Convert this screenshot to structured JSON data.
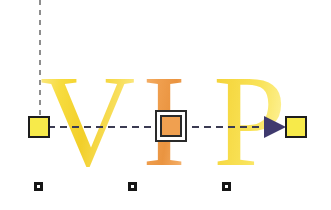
{
  "canvas": {
    "width": 331,
    "height": 210,
    "background": "#ffffff",
    "name": "gradient-edit-canvas"
  },
  "wordart": {
    "text": "VIP",
    "letters": [
      {
        "char": "V",
        "name": "letter-v",
        "color": "#f7dc3e",
        "highlight": "#fdf0a8"
      },
      {
        "char": "I",
        "name": "letter-i",
        "color": "#f0a050",
        "highlight": "#f8c58f"
      },
      {
        "char": "P",
        "name": "letter-p",
        "color": "#f6d943",
        "highlight": "#fffae0"
      }
    ]
  },
  "overlay": {
    "vertical_guide": {
      "name": "vertical-dashed-guide",
      "color": "#8d8d8d",
      "style": "dashed",
      "x": 40,
      "y_start": 0,
      "y_end": 120
    },
    "axis": {
      "name": "gradient-axis-line",
      "color": "#3b3b52",
      "style": "dash-dot",
      "y": 127,
      "x_start": 48,
      "x_end": 288
    },
    "handles": [
      {
        "name": "gradient-start-handle",
        "type": "square",
        "fill": "#f7ea4a",
        "border": "#1d1d1d",
        "x": 39,
        "y": 127,
        "selected": false
      },
      {
        "name": "gradient-center-handle",
        "type": "square-framed",
        "fill": "#f0a050",
        "border": "#2a2a2a",
        "x": 171,
        "y": 127,
        "selected": true
      },
      {
        "name": "gradient-end-handle",
        "type": "square",
        "fill": "#f7ea4a",
        "border": "#1d1d1d",
        "x": 296,
        "y": 127,
        "selected": false
      }
    ],
    "arrow": {
      "name": "gradient-direction-arrow",
      "color": "#3f3a6e",
      "direction": "right",
      "x": 275,
      "y": 127
    },
    "anchors": [
      {
        "name": "baseline-anchor-1",
        "fill": "#ffffff",
        "border": "#161616",
        "x": 38,
        "y": 186
      },
      {
        "name": "baseline-anchor-2",
        "fill": "#ffffff",
        "border": "#161616",
        "x": 132,
        "y": 186
      },
      {
        "name": "baseline-anchor-3",
        "fill": "#ffffff",
        "border": "#161616",
        "x": 226,
        "y": 186
      }
    ]
  }
}
